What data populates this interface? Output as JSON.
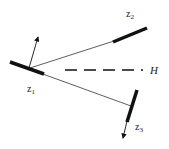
{
  "diagram": {
    "title": "",
    "nodes": [
      {
        "id": "z1",
        "label": "z",
        "subscript": "1"
      },
      {
        "id": "z2",
        "label": "z",
        "subscript": "2"
      },
      {
        "id": "z3",
        "label": "z",
        "subscript": "3"
      }
    ],
    "reference_line": {
      "label": "H",
      "style": "dashed"
    },
    "colors": {
      "stroke": "#111111",
      "background": "#ffffff"
    }
  }
}
